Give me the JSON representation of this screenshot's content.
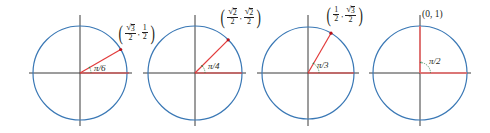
{
  "figure": {
    "colors": {
      "circle": "#3a78b5",
      "axis": "#3a3a3a",
      "ray": "#e23b3b",
      "point": "#b5121b",
      "angle_arc": "#2f7d4a",
      "text": "#231f20"
    },
    "panels": [
      {
        "angle_label": "π/6",
        "angle_deg": 30,
        "point_label": {
          "x_num": "√3",
          "x_den": "2",
          "y_num": "1",
          "y_den": "2",
          "x_has_sqrt": true,
          "y_has_sqrt": false
        },
        "center": [
          80,
          73
        ],
        "radius": 47
      },
      {
        "angle_label": "π/4",
        "angle_deg": 45,
        "point_label": {
          "x_num": "√2",
          "x_den": "2",
          "y_num": "√2",
          "y_den": "2",
          "x_has_sqrt": true,
          "y_has_sqrt": true
        },
        "center": [
          195,
          73
        ],
        "radius": 47
      },
      {
        "angle_label": "π/3",
        "angle_deg": 60,
        "point_label": {
          "x_num": "1",
          "x_den": "2",
          "y_num": "√3",
          "y_den": "2",
          "x_has_sqrt": false,
          "y_has_sqrt": true
        },
        "center": [
          308,
          73
        ],
        "radius": 46
      },
      {
        "angle_label": "π/2",
        "angle_deg": 90,
        "point_label": {
          "text": "(0, 1)"
        },
        "center": [
          420,
          73
        ],
        "radius": 47
      }
    ],
    "sqrt_symbol": "√",
    "sqrt_radicands": {
      "p1x": "3",
      "p2x": "2",
      "p2y": "2",
      "p3y": "3"
    },
    "plain": {
      "one": "1",
      "two": "2",
      "comma": ",",
      "lparen": "(",
      "rparen": ")"
    }
  }
}
